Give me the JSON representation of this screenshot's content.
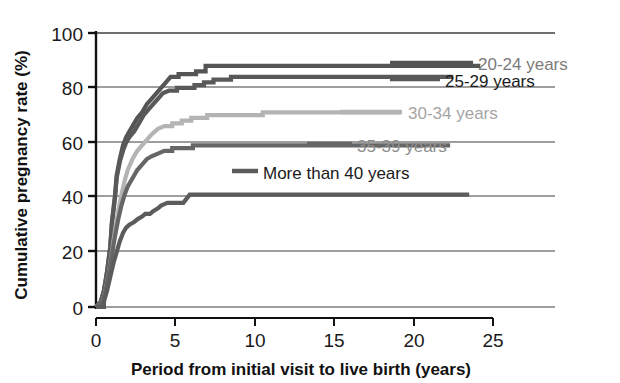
{
  "chart_data": {
    "type": "line",
    "title": "",
    "xlabel": "Period from initial visit to live birth (years)",
    "ylabel": "Cumulative pregnancy rate (%)",
    "xlim": [
      0,
      25
    ],
    "ylim": [
      0,
      100
    ],
    "xticks": [
      "0",
      "5",
      "10",
      "15",
      "20",
      "25"
    ],
    "xtick_values": [
      0,
      5,
      10,
      15,
      20,
      25
    ],
    "yticks": [
      "0",
      "20",
      "40",
      "60",
      "80",
      "100"
    ],
    "ytick_values": [
      0,
      20,
      40,
      60,
      80,
      100
    ],
    "grid": true,
    "grid_axis": "y",
    "legend_position": "inside-right",
    "series": [
      {
        "name": "20-24 years",
        "color": "#555555",
        "plateau": 88,
        "label_color": "#7b7b7b",
        "points": [
          [
            0.0,
            0
          ],
          [
            0.3,
            2
          ],
          [
            0.5,
            6
          ],
          [
            0.7,
            13
          ],
          [
            0.9,
            22
          ],
          [
            1.0,
            31
          ],
          [
            1.2,
            41
          ],
          [
            1.3,
            48
          ],
          [
            1.5,
            54
          ],
          [
            1.7,
            59
          ],
          [
            1.9,
            62
          ],
          [
            2.1,
            64
          ],
          [
            2.3,
            66
          ],
          [
            2.6,
            69
          ],
          [
            2.9,
            71
          ],
          [
            3.2,
            74
          ],
          [
            3.5,
            76
          ],
          [
            3.8,
            78
          ],
          [
            4.1,
            80
          ],
          [
            4.4,
            82
          ],
          [
            4.7,
            84
          ],
          [
            5.2,
            85
          ],
          [
            5.6,
            85
          ],
          [
            6.3,
            86
          ],
          [
            6.9,
            88
          ],
          [
            9.5,
            88
          ],
          [
            14.0,
            88
          ],
          [
            20.0,
            88
          ],
          [
            24.2,
            88
          ]
        ]
      },
      {
        "name": "25-29 years",
        "color": "#595959",
        "plateau": 84,
        "label_color": "#1a1a1a",
        "points": [
          [
            0.0,
            0
          ],
          [
            0.3,
            2
          ],
          [
            0.5,
            6
          ],
          [
            0.7,
            13
          ],
          [
            0.9,
            22
          ],
          [
            1.0,
            30
          ],
          [
            1.2,
            40
          ],
          [
            1.3,
            47
          ],
          [
            1.5,
            53
          ],
          [
            1.7,
            57
          ],
          [
            1.9,
            60
          ],
          [
            2.1,
            62
          ],
          [
            2.4,
            64
          ],
          [
            2.7,
            67
          ],
          [
            3.0,
            70
          ],
          [
            3.3,
            72
          ],
          [
            3.6,
            74
          ],
          [
            3.9,
            76
          ],
          [
            4.2,
            78
          ],
          [
            4.6,
            79
          ],
          [
            5.1,
            80
          ],
          [
            5.6,
            80
          ],
          [
            6.2,
            81
          ],
          [
            6.8,
            82
          ],
          [
            7.4,
            83
          ],
          [
            8.5,
            84
          ],
          [
            10.5,
            84
          ],
          [
            15.0,
            84
          ],
          [
            20.0,
            84
          ],
          [
            22.5,
            84
          ]
        ]
      },
      {
        "name": "30-34 years",
        "color": "#b4b4b4",
        "plateau": 71,
        "label_color": "#a5a5a5",
        "points": [
          [
            0.0,
            0
          ],
          [
            0.4,
            2
          ],
          [
            0.6,
            6
          ],
          [
            0.8,
            12
          ],
          [
            1.0,
            20
          ],
          [
            1.2,
            28
          ],
          [
            1.4,
            35
          ],
          [
            1.6,
            41
          ],
          [
            1.8,
            46
          ],
          [
            2.0,
            50
          ],
          [
            2.3,
            54
          ],
          [
            2.6,
            57
          ],
          [
            2.9,
            59
          ],
          [
            3.2,
            61
          ],
          [
            3.5,
            63
          ],
          [
            3.9,
            65
          ],
          [
            4.3,
            66
          ],
          [
            4.8,
            67
          ],
          [
            5.4,
            68
          ],
          [
            6.0,
            69
          ],
          [
            7.0,
            70
          ],
          [
            8.5,
            70
          ],
          [
            10.5,
            71
          ],
          [
            13.0,
            71
          ],
          [
            16.0,
            71
          ],
          [
            19.2,
            71
          ]
        ]
      },
      {
        "name": "35-39 years",
        "color": "#666666",
        "plateau": 59,
        "label_color": "#8c8c8c",
        "points": [
          [
            0.0,
            0
          ],
          [
            0.4,
            2
          ],
          [
            0.6,
            6
          ],
          [
            0.8,
            12
          ],
          [
            1.0,
            19
          ],
          [
            1.2,
            26
          ],
          [
            1.4,
            32
          ],
          [
            1.6,
            37
          ],
          [
            1.8,
            41
          ],
          [
            2.0,
            44
          ],
          [
            2.3,
            47
          ],
          [
            2.6,
            50
          ],
          [
            2.9,
            52
          ],
          [
            3.2,
            54
          ],
          [
            3.5,
            55
          ],
          [
            3.9,
            56
          ],
          [
            4.3,
            57
          ],
          [
            4.8,
            58
          ],
          [
            5.4,
            58
          ],
          [
            6.1,
            59
          ],
          [
            7.5,
            59
          ],
          [
            10.0,
            59
          ],
          [
            14.0,
            59
          ],
          [
            18.0,
            59
          ],
          [
            22.3,
            59
          ]
        ]
      },
      {
        "name": "More than 40 years",
        "color": "#5c5c5c",
        "plateau": 41,
        "label_color": "#1a1a1a",
        "points": [
          [
            0.0,
            0
          ],
          [
            0.5,
            2
          ],
          [
            0.7,
            6
          ],
          [
            0.9,
            11
          ],
          [
            1.1,
            16
          ],
          [
            1.3,
            20
          ],
          [
            1.5,
            24
          ],
          [
            1.7,
            27
          ],
          [
            1.9,
            29
          ],
          [
            2.1,
            30
          ],
          [
            2.4,
            31
          ],
          [
            2.6,
            32
          ],
          [
            2.9,
            33
          ],
          [
            3.1,
            34
          ],
          [
            3.4,
            34
          ],
          [
            3.6,
            35
          ],
          [
            3.9,
            36
          ],
          [
            4.1,
            37
          ],
          [
            4.5,
            38
          ],
          [
            5.0,
            38
          ],
          [
            5.5,
            38
          ],
          [
            5.9,
            41
          ],
          [
            8.0,
            41
          ],
          [
            12.0,
            41
          ],
          [
            17.0,
            41
          ],
          [
            23.5,
            41
          ]
        ]
      }
    ]
  },
  "legend": {
    "entries": [
      {
        "label": "20-24 years",
        "color": "#555555",
        "text_color": "#7b7b7b"
      },
      {
        "label": "25-29 years",
        "color": "#595959",
        "text_color": "#1a1a1a"
      },
      {
        "label": "30-34 years",
        "color": "#b4b4b4",
        "text_color": "#a5a5a5"
      },
      {
        "label": "35-39 years",
        "color": "#666666",
        "text_color": "#8c8c8c"
      },
      {
        "label": "More than 40 years",
        "color": "#5c5c5c",
        "text_color": "#1a1a1a"
      }
    ]
  },
  "axes": {
    "x_title": "Period from initial visit to live birth (years)",
    "y_title": "Cumulative pregnancy rate (%)",
    "x_tick_0": "0",
    "x_tick_1": "5",
    "x_tick_2": "10",
    "x_tick_3": "15",
    "x_tick_4": "20",
    "x_tick_5": "25",
    "y_tick_0": "0",
    "y_tick_1": "20",
    "y_tick_2": "40",
    "y_tick_3": "60",
    "y_tick_4": "80",
    "y_tick_5": "100"
  },
  "colors": {
    "axis": "#1a1a1a",
    "grid": "#4a4a4a",
    "background": "#ffffff"
  }
}
